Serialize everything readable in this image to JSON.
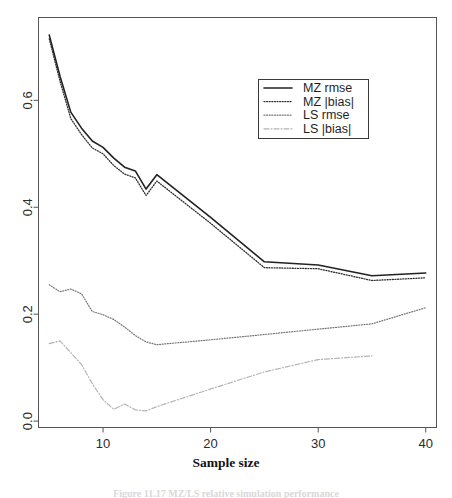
{
  "figure": {
    "background_color": "#ffffff",
    "frame_color": "#555555",
    "caption_partial": "Figure 11.17  MZ/LS relative simulation performance",
    "x_axis_title": "Sample size"
  },
  "chart_data": {
    "type": "line",
    "title": "",
    "xlabel": "Sample size",
    "ylabel": "",
    "xlim": [
      4,
      41
    ],
    "ylim": [
      -0.012,
      0.755
    ],
    "xticks": [
      10,
      20,
      30,
      40
    ],
    "yticks": [
      0.0,
      0.2,
      0.4,
      0.6
    ],
    "xtick_labels": [
      "10",
      "20",
      "30",
      "40"
    ],
    "ytick_labels": [
      "0.0",
      "0.2",
      "0.4",
      "0.6"
    ],
    "grid": false,
    "legend_position": "upper-right-inside",
    "x": [
      5,
      6,
      7,
      8,
      9,
      10,
      11,
      12,
      13,
      14,
      15,
      20,
      25,
      30,
      35,
      40
    ],
    "series": [
      {
        "name": "MZ rmse",
        "label": "MZ rmse",
        "style": "solid",
        "color": "#222222",
        "width": 1.6,
        "values": [
          0.722,
          0.645,
          0.578,
          0.548,
          0.524,
          0.512,
          0.492,
          0.475,
          0.468,
          0.434,
          0.461,
          0.381,
          0.298,
          0.292,
          0.272,
          0.277
        ]
      },
      {
        "name": "MZ |bias|",
        "label": "MZ |bias|",
        "style": "dotted",
        "color": "#2e2e2e",
        "width": 1.3,
        "values": [
          0.715,
          0.636,
          0.566,
          0.536,
          0.511,
          0.5,
          0.478,
          0.462,
          0.455,
          0.422,
          0.449,
          0.37,
          0.287,
          0.285,
          0.263,
          0.268
        ]
      },
      {
        "name": "LS rmse",
        "label": "LS rmse",
        "style": "dotted",
        "color": "#777777",
        "width": 1.2,
        "values": [
          0.255,
          0.242,
          0.247,
          0.238,
          0.205,
          0.199,
          0.19,
          0.176,
          0.16,
          0.148,
          0.143,
          0.152,
          0.162,
          0.172,
          0.182,
          0.212
        ]
      },
      {
        "name": "LS |bias|",
        "label": "LS |bias|",
        "style": "dashdot",
        "color": "#b4b4b4",
        "width": 1.2,
        "values": [
          0.145,
          0.15,
          0.128,
          0.106,
          0.07,
          0.04,
          0.022,
          0.032,
          0.021,
          0.019,
          0.027,
          0.06,
          0.092,
          0.115,
          0.122,
          0.14
        ]
      }
    ],
    "series_endpoint_note": {
      "LS |bias|": 35
    },
    "annotations": []
  },
  "legend": {
    "items": [
      {
        "label": "MZ rmse",
        "style": "solid",
        "color": "#222222"
      },
      {
        "label": "MZ |bias|",
        "style": "dotted",
        "color": "#2e2e2e"
      },
      {
        "label": "LS rmse",
        "style": "dotted",
        "color": "#777777"
      },
      {
        "label": "LS |bias|",
        "style": "dashdot",
        "color": "#b4b4b4"
      }
    ]
  }
}
